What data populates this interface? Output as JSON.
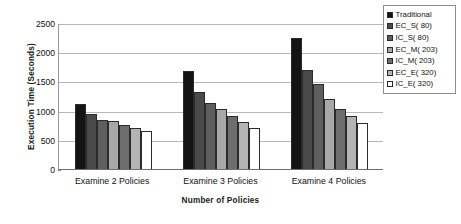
{
  "chart_data": {
    "type": "bar",
    "title": "",
    "xlabel": "Number of Policies",
    "ylabel": "Execution Time (Seconds)",
    "ylim": [
      0,
      2500
    ],
    "ytick_step": 500,
    "yticks": [
      "0",
      "500",
      "1000",
      "1500",
      "2000",
      "2500"
    ],
    "grid": true,
    "legend_position": "top-right",
    "categories": [
      "Examine 2 Policies",
      "Examine 3 Policies",
      "Examine 4 Policies"
    ],
    "series": [
      {
        "name": "Traditional",
        "color": "#141414",
        "values": [
          1120,
          1680,
          2250
        ]
      },
      {
        "name": "EC_S( 80)",
        "color": "#4a4a4a",
        "values": [
          940,
          1320,
          1700
        ]
      },
      {
        "name": "IC_S( 80)",
        "color": "#5e5e5e",
        "values": [
          840,
          1130,
          1450
        ]
      },
      {
        "name": "EC_M( 203)",
        "color": "#a8a8a8",
        "values": [
          820,
          1030,
          1200
        ]
      },
      {
        "name": "IC_M( 203)",
        "color": "#6e6e6e",
        "values": [
          750,
          900,
          1030
        ]
      },
      {
        "name": "EC_E( 320)",
        "color": "#b4b4b4",
        "values": [
          700,
          800,
          900
        ]
      },
      {
        "name": "IC_E( 320)",
        "color": "#ffffff",
        "values": [
          650,
          700,
          790
        ]
      }
    ]
  }
}
